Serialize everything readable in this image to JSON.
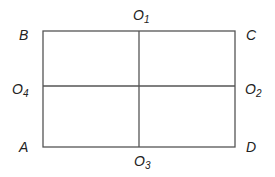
{
  "diagram": {
    "type": "rectangle-with-midlines",
    "stroke_color": "#555555",
    "label_color": "#222222",
    "rectangle": {
      "x": 43,
      "y": 31,
      "width": 192,
      "height": 116
    },
    "midlines": {
      "vertical_x": 139,
      "horizontal_y": 86
    },
    "corners": {
      "B": {
        "label": "B",
        "position": "top-left"
      },
      "C": {
        "label": "C",
        "position": "top-right"
      },
      "A": {
        "label": "A",
        "position": "bottom-left"
      },
      "D": {
        "label": "D",
        "position": "bottom-right"
      }
    },
    "midpoints": {
      "O1": {
        "main": "O",
        "sub": "1",
        "position": "top-middle"
      },
      "O2": {
        "main": "O",
        "sub": "2",
        "position": "right-middle"
      },
      "O3": {
        "main": "O",
        "sub": "3",
        "position": "bottom-middle"
      },
      "O4": {
        "main": "O",
        "sub": "4",
        "position": "left-middle"
      }
    }
  }
}
